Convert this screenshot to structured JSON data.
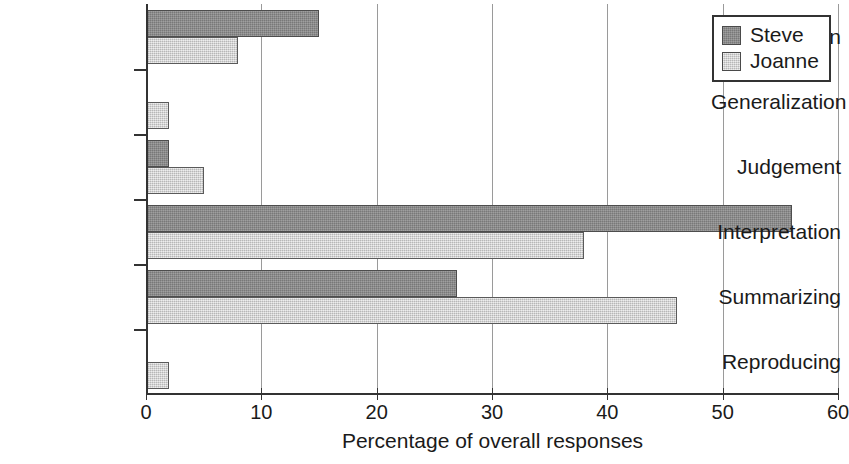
{
  "chart_data": {
    "type": "bar",
    "orientation": "horizontal",
    "title": "",
    "xlabel": "Percentage of overall responses",
    "ylabel": "",
    "xlim": [
      0,
      60
    ],
    "xticks": [
      0,
      10,
      20,
      30,
      40,
      50,
      60
    ],
    "xtick_labels": [
      "0",
      "10",
      "20",
      "30",
      "40",
      "50",
      "60"
    ],
    "grid": "vertical",
    "legend_position": "top-right",
    "categories": [
      "Abstraction",
      "Generalization",
      "Judgement",
      "Interpretation",
      "Summarizing",
      "Reproducing"
    ],
    "series": [
      {
        "name": "Steve",
        "color": "#888888",
        "values": [
          15,
          0,
          2,
          56,
          27,
          0
        ]
      },
      {
        "name": "Joanne",
        "color": "#d4d4d4",
        "values": [
          8,
          2,
          5,
          38,
          46,
          2
        ]
      }
    ]
  },
  "legend": {
    "entries": [
      {
        "label": "Steve"
      },
      {
        "label": "Joanne"
      }
    ]
  }
}
